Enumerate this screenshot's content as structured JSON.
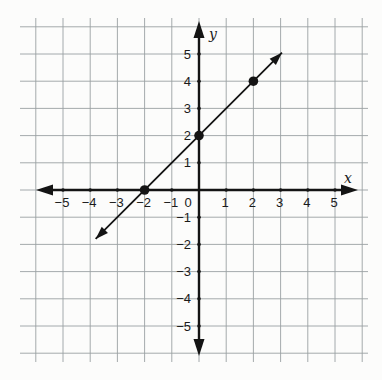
{
  "figure": {
    "background": "#fcfcfb"
  },
  "chart_data": {
    "type": "line",
    "title": "",
    "xlabel": "x",
    "ylabel": "y",
    "xlim": [
      -5,
      5
    ],
    "ylim": [
      -5,
      5
    ],
    "grid": true,
    "legend": false,
    "x_ticks": [
      -5,
      -4,
      -3,
      -2,
      -1,
      0,
      1,
      2,
      3,
      4,
      5
    ],
    "y_ticks": [
      5,
      4,
      3,
      2,
      1,
      -1,
      -2,
      -3,
      -4,
      -5
    ],
    "series": [
      {
        "name": "line-through-marked-points",
        "marked_points": [
          [
            -2,
            0
          ],
          [
            0,
            2
          ],
          [
            2,
            4
          ]
        ],
        "segment_start": [
          -3.8,
          -1.8
        ],
        "segment_end": [
          3.05,
          5.05
        ],
        "arrow_both_ends": true,
        "color": "#141414"
      }
    ],
    "colors": {
      "axis": "#141414",
      "grid": "#9aa0a3",
      "points": "#141414",
      "tick_labels": "#1a1a1a",
      "background": "#fcfcfb"
    }
  }
}
